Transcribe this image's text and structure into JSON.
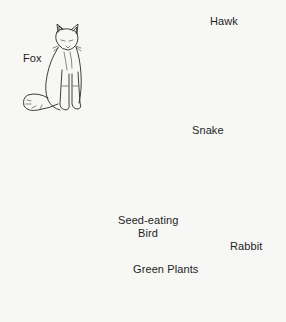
{
  "diagram": {
    "type": "food-web",
    "nodes": [
      {
        "id": "fox",
        "label": "Fox"
      },
      {
        "id": "hawk",
        "label": "Hawk"
      },
      {
        "id": "snake",
        "label": "Snake"
      },
      {
        "id": "bird",
        "label": "Seed-eating Bird",
        "label_lines": [
          "Seed-eating",
          "Bird"
        ]
      },
      {
        "id": "rabbit",
        "label": "Rabbit"
      },
      {
        "id": "plants",
        "label": "Green Plants"
      }
    ],
    "edges": [
      {
        "from": "plants",
        "to": "bird"
      },
      {
        "from": "plants",
        "to": "rabbit"
      },
      {
        "from": "bird",
        "to": "fox"
      },
      {
        "from": "bird",
        "to": "hawk"
      },
      {
        "from": "bird",
        "to": "snake"
      },
      {
        "from": "rabbit",
        "to": "fox"
      },
      {
        "from": "rabbit",
        "to": "snake"
      },
      {
        "from": "rabbit",
        "to": "hawk"
      },
      {
        "from": "snake",
        "to": "hawk"
      }
    ],
    "colors": {
      "background": "#f7f7f5",
      "ink": "#1a1a1a"
    }
  }
}
